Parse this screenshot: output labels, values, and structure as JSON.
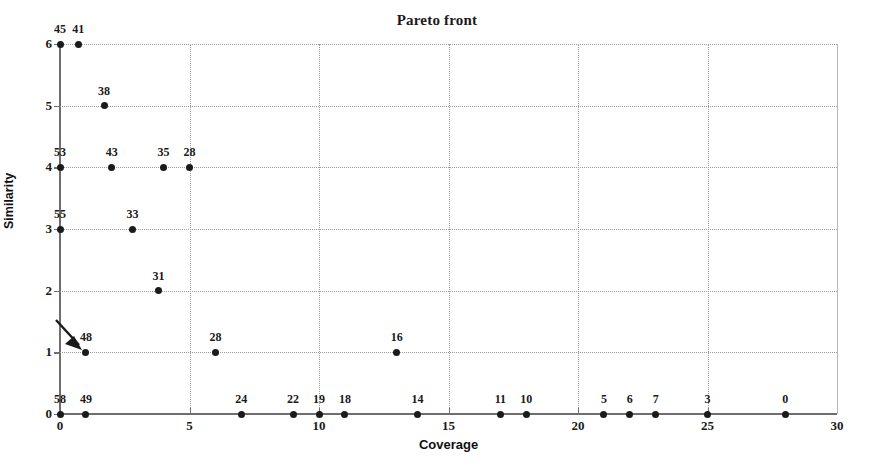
{
  "chart_data": {
    "type": "scatter",
    "title": "Pareto front",
    "xlabel": "Coverage",
    "ylabel": "Similarity",
    "xlim": [
      0,
      30
    ],
    "ylim": [
      0,
      6
    ],
    "grid": true,
    "legend": null,
    "xticks": [
      0,
      5,
      10,
      15,
      20,
      25,
      30
    ],
    "xticklabels": [
      "0",
      "5",
      "10",
      "15",
      "20",
      "25",
      "30"
    ],
    "yticks": [
      0,
      1,
      2,
      3,
      4,
      5,
      6
    ],
    "yticklabels": [
      "0",
      "1",
      "2",
      "3",
      "4",
      "5",
      "6"
    ],
    "point_label_meaning": "solution id annotated above each marker",
    "points": [
      {
        "x": 0,
        "y": 6,
        "label": "45"
      },
      {
        "x": 0.7,
        "y": 6,
        "label": "41"
      },
      {
        "x": 1.7,
        "y": 5,
        "label": "38"
      },
      {
        "x": 0,
        "y": 4,
        "label": "53"
      },
      {
        "x": 2,
        "y": 4,
        "label": "43"
      },
      {
        "x": 4,
        "y": 4,
        "label": "35"
      },
      {
        "x": 5,
        "y": 4,
        "label": "28"
      },
      {
        "x": 0,
        "y": 3,
        "label": "55"
      },
      {
        "x": 2.8,
        "y": 3,
        "label": "33"
      },
      {
        "x": 3.8,
        "y": 2,
        "label": "31"
      },
      {
        "x": 1,
        "y": 1,
        "label": "48"
      },
      {
        "x": 6,
        "y": 1,
        "label": "28"
      },
      {
        "x": 13,
        "y": 1,
        "label": "16"
      },
      {
        "x": 0,
        "y": 0,
        "label": "58"
      },
      {
        "x": 1,
        "y": 0,
        "label": "49"
      },
      {
        "x": 7,
        "y": 0,
        "label": "24"
      },
      {
        "x": 9,
        "y": 0,
        "label": "22"
      },
      {
        "x": 10,
        "y": 0,
        "label": "19"
      },
      {
        "x": 11,
        "y": 0,
        "label": "18"
      },
      {
        "x": 13.8,
        "y": 0,
        "label": "14"
      },
      {
        "x": 17,
        "y": 0,
        "label": "11"
      },
      {
        "x": 18,
        "y": 0,
        "label": "10"
      },
      {
        "x": 21,
        "y": 0,
        "label": "5"
      },
      {
        "x": 22,
        "y": 0,
        "label": "6"
      },
      {
        "x": 23,
        "y": 0,
        "label": "7"
      },
      {
        "x": 25,
        "y": 0,
        "label": "3"
      },
      {
        "x": 28,
        "y": 0,
        "label": "0"
      }
    ],
    "annotations": [
      {
        "type": "arrow",
        "target_x": 1,
        "target_y": 1,
        "direction": "down-right"
      }
    ],
    "colors": {
      "marker": "#1b1b1b",
      "axis": "#6e6e6e",
      "grid": "#9a9a9a",
      "text": "#1a1a1a",
      "background": "#ffffff"
    }
  }
}
